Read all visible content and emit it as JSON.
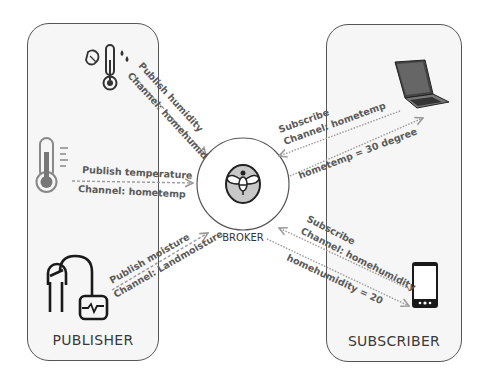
{
  "publisher": {
    "label": "PUBLISHER",
    "devices": [
      {
        "icon": "humidity-thermometer-icon",
        "message": "Publish humidity",
        "channel": "Channel: homehumidity"
      },
      {
        "icon": "thermometer-icon",
        "message": "Publish temperature",
        "channel": "Channel: hometemp"
      },
      {
        "icon": "soil-moisture-sensor-icon",
        "message": "Publish moisture",
        "channel": "Channel: Landmoisture"
      }
    ]
  },
  "broker": {
    "label": "BROKER",
    "icon": "bee-icon"
  },
  "subscriber": {
    "label": "SUBSCRIBER",
    "devices": [
      {
        "icon": "laptop-icon",
        "request": "Subscribe",
        "channel": "Channel: hometemp",
        "response": "hometemp = 30 degree"
      },
      {
        "icon": "smartphone-icon",
        "request": "Subscribe",
        "channel": "Channel: homehumidity",
        "response": "homehumidity = 20"
      }
    ]
  },
  "colors": {
    "panel_bg": "#f6f6f6",
    "panel_border": "#555555",
    "arrow": "#9a9a9a",
    "text": "#5a5a5a",
    "bee_circle": "#c8c8c8"
  }
}
